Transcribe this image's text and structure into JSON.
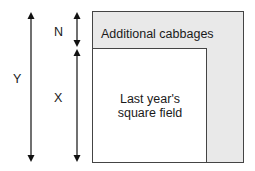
{
  "diagram": {
    "labels": {
      "y": "Y",
      "n": "N",
      "x": "X",
      "outer_region": "Additional cabbages",
      "inner_line1": "Last year's",
      "inner_line2": "square field"
    },
    "colors": {
      "outer_fill": "#e9e9e9",
      "inner_fill": "#ffffff",
      "stroke": "#444444",
      "arrow": "#111111"
    }
  }
}
